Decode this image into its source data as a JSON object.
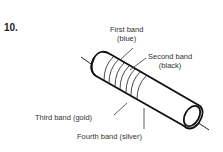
{
  "figure": {
    "number": "10.",
    "labels": {
      "first_band": "First band",
      "first_band_color": "(blue)",
      "second_band": "Second band",
      "second_band_color": "(black)",
      "third_band": "Third band (gold)",
      "fourth_band": "Fourth band (silver)"
    }
  }
}
